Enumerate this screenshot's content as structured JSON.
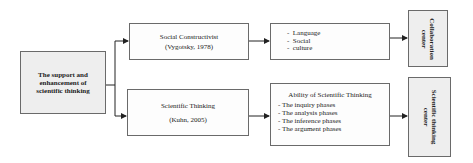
{
  "diagram": {
    "root": {
      "lines": [
        "The support and",
        "enhancement of",
        "scientific thinking"
      ]
    },
    "branch_top": {
      "title": "Social Constructivist",
      "citation": "(Vygotsky, 1978)",
      "items": [
        "Language",
        "Social",
        "culture"
      ],
      "outcome_lines": [
        "Collaboration",
        "center"
      ]
    },
    "branch_bottom": {
      "title": "Scientific Thinking",
      "citation": "(Kuhn, 2005)",
      "detail_title": "Ability of Scientific Thinking",
      "items": [
        "- The inquiry phases",
        "- The analysis phases",
        "- The inference phases",
        "- The argument phases"
      ],
      "outcome_lines": [
        "Scientific thinking",
        "center"
      ]
    },
    "colors": {
      "border": "#6a6a6a",
      "fill_grey": "#eeeeee",
      "line": "#222222"
    }
  }
}
